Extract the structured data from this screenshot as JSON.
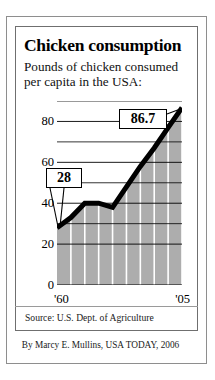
{
  "title": "Chicken consumption",
  "subtitle_line1": "Pounds of chicken consumed",
  "subtitle_line2": "per capita in the USA:",
  "source": "Source: U.S. Dept. of Agriculture",
  "credit": "By Marcy E. Mullins, USA TODAY, 2006",
  "callouts": {
    "start_value": "28",
    "end_value": "86.7"
  },
  "colors": {
    "area_fill": "#adadad",
    "gridline": "#ffffff",
    "line": "#000000",
    "frame": "#8e8e8e",
    "text": "#000000"
  },
  "chart_data": {
    "type": "area",
    "title": "Chicken consumption",
    "subtitle": "Pounds of chicken consumed per capita in the USA:",
    "xlabel": "",
    "ylabel": "",
    "xlim": [
      1960,
      2005
    ],
    "ylim": [
      0,
      90
    ],
    "yticks": [
      0,
      20,
      40,
      60,
      80
    ],
    "ytick_labels": [
      "0",
      "20",
      "40",
      "60",
      "80"
    ],
    "xticks": [
      1960,
      2005
    ],
    "xtick_labels": [
      "'60",
      "'05"
    ],
    "grid": "vertical-white-bands-every-5-years",
    "legend": "none",
    "annotations": [
      {
        "label": "28",
        "x": 1960,
        "y": 28
      },
      {
        "label": "86.7",
        "x": 2005,
        "y": 86.7
      }
    ],
    "x": [
      1960,
      1965,
      1970,
      1975,
      1980,
      1985,
      1990,
      1995,
      2000,
      2005
    ],
    "values": [
      28,
      33,
      40,
      40,
      38,
      48,
      58,
      67,
      77,
      86.7
    ],
    "series": [
      {
        "name": "Pounds of chicken consumed per capita",
        "values": [
          28,
          33,
          40,
          40,
          38,
          48,
          58,
          67,
          77,
          86.7
        ]
      }
    ]
  }
}
